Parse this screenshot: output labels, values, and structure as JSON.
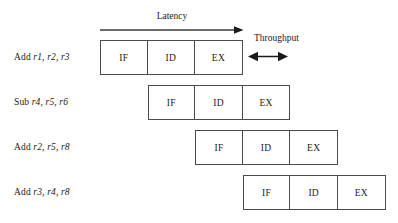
{
  "figure": {
    "type": "pipeline-timing-diagram",
    "background_color": "#ffffff",
    "box_border_color": "#4a4a4a",
    "text_color": "#1a1a1a"
  },
  "annotations": {
    "latency": {
      "label": "Latency",
      "arrow": "single-headed-right",
      "spans_stages": 3
    },
    "throughput": {
      "label": "Throughput",
      "arrow": "double-headed-horizontal",
      "spans_stages": 1
    }
  },
  "stage_names": [
    "IF",
    "ID",
    "EX"
  ],
  "rows": [
    {
      "op": "Add ",
      "regs": "r1, r2, r3",
      "stages": [
        "IF",
        "ID",
        "EX"
      ],
      "start_offset": 0
    },
    {
      "op": "Sub ",
      "regs": "r4, r5, r6",
      "stages": [
        "IF",
        "ID",
        "EX"
      ],
      "start_offset": 1
    },
    {
      "op": "Add ",
      "regs": "r2, r5, r8",
      "stages": [
        "IF",
        "ID",
        "EX"
      ],
      "start_offset": 2
    },
    {
      "op": "Add ",
      "regs": "r3, r4, r8",
      "stages": [
        "IF",
        "ID",
        "EX"
      ],
      "start_offset": 3
    }
  ]
}
